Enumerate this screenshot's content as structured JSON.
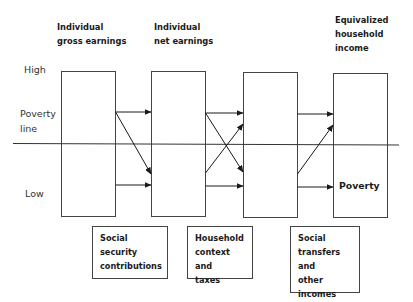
{
  "diagram": {
    "stages": [
      {
        "label_lines": [
          "Individual",
          "gross earnings"
        ]
      },
      {
        "label_lines": [
          "Individual",
          "net earnings"
        ]
      },
      {
        "label_lines": []
      },
      {
        "label_lines": [
          "Equivalized",
          "household",
          "income"
        ]
      }
    ],
    "levels": {
      "high": "High",
      "poverty_line": [
        "Poverty",
        "line"
      ],
      "low": "Low"
    },
    "outcome_label": "Poverty",
    "factors": [
      {
        "label_lines": [
          "Social security",
          "contributions"
        ]
      },
      {
        "label_lines": [
          "Household",
          "context and",
          "taxes"
        ]
      },
      {
        "label_lines": [
          "Social",
          "transfers and",
          "other",
          "incomes"
        ]
      }
    ],
    "colors": {
      "line": "#1a1a1a",
      "box_border": "#444444",
      "background": "#ffffff"
    }
  }
}
